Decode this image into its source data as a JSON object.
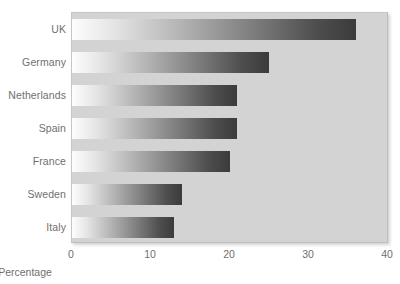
{
  "chart_data": {
    "type": "bar",
    "orientation": "horizontal",
    "title": "",
    "subtitle": "",
    "xlabel": "Percentage",
    "ylabel": "",
    "categories": [
      "UK",
      "Germany",
      "Netherlands",
      "Spain",
      "France",
      "Sweden",
      "Italy"
    ],
    "values": [
      36,
      25,
      21,
      21,
      20,
      14,
      13
    ],
    "series": [
      {
        "name": "Percentage",
        "values": [
          36,
          25,
          21,
          21,
          20,
          14,
          13
        ]
      }
    ],
    "xlim": [
      0,
      40
    ],
    "xticks": [
      0,
      10,
      20,
      30,
      40
    ],
    "xtick_labels": [
      "0",
      "10",
      "20",
      "30",
      "40"
    ],
    "grid": false,
    "legend": false,
    "legend_position": "none",
    "annotations": []
  },
  "style": {
    "plot_background": "#d3d3d3",
    "page_background": "#ffffff",
    "bar_gradient_start": "#fdfdfd",
    "bar_gradient_end": "#3b3b3b",
    "text_color": "#6f6f6f"
  }
}
